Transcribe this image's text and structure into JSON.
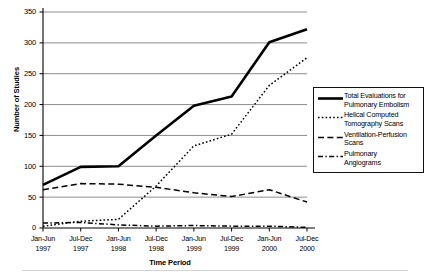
{
  "axes": {
    "y_title": "Number of Studies",
    "x_title": "Time Period",
    "y_ticks": [
      "0",
      "50",
      "100",
      "150",
      "200",
      "250",
      "300",
      "350"
    ],
    "x_ticks": [
      "Jan-Jun\n1997",
      "Jul-Dec\n1997",
      "Jan-Jun\n1998",
      "Jul-Dec\n1998",
      "Jan-Jun\n1999",
      "Jul-Dec\n1999",
      "Jan-Jun\n2000",
      "Jul-Dec\n2000"
    ]
  },
  "legend": {
    "items": [
      {
        "label": "Total Evaluations for\nPulmonary Embolism",
        "style": "solid-thick"
      },
      {
        "label": "Helical Computed\nTomography Scans",
        "style": "dotted"
      },
      {
        "label": "Ventilation-Perfusion\nScans",
        "style": "long-dash"
      },
      {
        "label": "Pulmonary\nAngiograms",
        "style": "dash-dot"
      }
    ]
  },
  "colors": {
    "line": "#000000",
    "grid": "#808080",
    "axis": "#000000",
    "background": "#ffffff"
  },
  "chart_data": {
    "type": "line",
    "title": "",
    "xlabel": "Time Period",
    "ylabel": "Number of Studies",
    "categories": [
      "Jan-Jun 1997",
      "Jul-Dec 1997",
      "Jan-Jun 1998",
      "Jul-Dec 1998",
      "Jan-Jun 1999",
      "Jul-Dec 1999",
      "Jan-Jun 2000",
      "Jul-Dec 2000"
    ],
    "ylim": [
      0,
      350
    ],
    "xlim_categories": 8,
    "yticks": [
      0,
      50,
      100,
      150,
      200,
      250,
      300,
      350
    ],
    "grid": "horizontal",
    "legend_position": "right",
    "series": [
      {
        "name": "Total Evaluations for Pulmonary Embolism",
        "style": "solid-thick",
        "values": [
          70,
          99,
          100,
          150,
          198,
          213,
          301,
          322
        ]
      },
      {
        "name": "Helical Computed Tomography Scans",
        "style": "dotted",
        "values": [
          3,
          11,
          14,
          68,
          133,
          152,
          231,
          276
        ]
      },
      {
        "name": "Ventilation-Perfusion Scans",
        "style": "long-dash",
        "values": [
          62,
          72,
          71,
          66,
          57,
          51,
          62,
          42
        ]
      },
      {
        "name": "Pulmonary Angiograms",
        "style": "dash-dot",
        "values": [
          8,
          9,
          5,
          3,
          4,
          3,
          3,
          1
        ]
      }
    ]
  }
}
